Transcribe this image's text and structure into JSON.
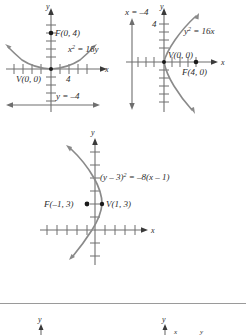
{
  "figure": {
    "colors": {
      "curve": "#8a8a8a",
      "axis": "#6e6e6e",
      "text": "#2b2b2b",
      "divider": "#9a9a9a",
      "point": "#1a1a1a",
      "background": "#ffffff"
    }
  },
  "graphs": [
    {
      "id": "graph-1",
      "equation_label": "x",
      "equation_sup": "2",
      "equation_rest": " = 16y",
      "focus_label": "F(0, 4)",
      "vertex_label": "V(0, 0)",
      "directrix_label": "y = –4",
      "tick_label": "4",
      "axis_x_label": "x",
      "axis_y_label": "y",
      "orientation": "opens-up",
      "focus": [
        0,
        4
      ],
      "vertex": [
        0,
        0
      ],
      "directrix": "y = -4",
      "p": 4
    },
    {
      "id": "graph-2",
      "equation_label": "y",
      "equation_sup": "2",
      "equation_rest": " = 16x",
      "focus_label": "F(4, 0)",
      "vertex_label": "V(0, 0)",
      "directrix_label": "x = –4",
      "tick_label": "4",
      "axis_x_label": "x",
      "axis_y_label": "y",
      "orientation": "opens-right",
      "focus": [
        4,
        0
      ],
      "vertex": [
        0,
        0
      ],
      "directrix": "x = -4",
      "p": 4
    },
    {
      "id": "graph-3",
      "equation_prefix": "(y – 3)",
      "equation_sup": "2",
      "equation_rest": " = –8(x – 1)",
      "focus_label": "F(–1, 3)",
      "vertex_label": "V(1, 3)",
      "axis_x_label": "x",
      "axis_y_label": "y",
      "orientation": "opens-left",
      "focus": [
        -1,
        3
      ],
      "vertex": [
        1,
        3
      ],
      "p": -2
    },
    {
      "id": "graph-4",
      "axis_y_label": "y",
      "orientation": "partial-cropped"
    },
    {
      "id": "graph-5",
      "axis_y_label": "y",
      "orientation": "partial-cropped"
    }
  ]
}
